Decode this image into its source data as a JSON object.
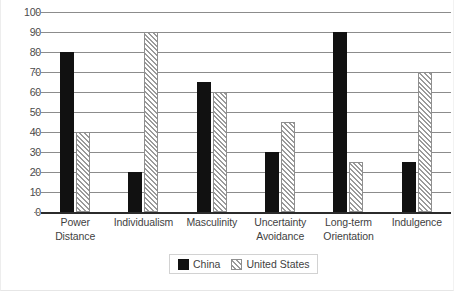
{
  "chart_data": {
    "type": "bar",
    "title": "",
    "xlabel": "",
    "ylabel": "",
    "ylim": [
      0,
      100
    ],
    "yticks": [
      0,
      10,
      20,
      30,
      40,
      50,
      60,
      70,
      80,
      90,
      100
    ],
    "ytick_labels": [
      "0",
      "10",
      "20",
      "30",
      "40",
      "50",
      "60",
      "70",
      "80",
      "90",
      "100"
    ],
    "grid": true,
    "legend_position": "bottom-center",
    "categories": [
      "Power Distance",
      "Individualism",
      "Masculinity",
      "Uncertainty Avoidance",
      "Long-term Orientation",
      "Indulgence"
    ],
    "category_lines": [
      [
        "Power",
        "Distance"
      ],
      [
        "Individualism"
      ],
      [
        "Masculinity"
      ],
      [
        "Uncertainty",
        "Avoidance"
      ],
      [
        "Long-term",
        "Orientation"
      ],
      [
        "Indulgence"
      ]
    ],
    "series": [
      {
        "name": "China",
        "values": [
          80,
          20,
          65,
          30,
          90,
          25
        ],
        "color": "#111111",
        "pattern": "solid"
      },
      {
        "name": "United States",
        "values": [
          40,
          90,
          60,
          45,
          25,
          70
        ],
        "color": "#c9c9c9",
        "pattern": "diagonal-hatch"
      }
    ]
  },
  "legend": {
    "entries": [
      {
        "label": "China",
        "swatch": "solid-black-swatch"
      },
      {
        "label": "United States",
        "swatch": "hatched-gray-swatch"
      }
    ]
  },
  "colors": {
    "background": "#ffffff",
    "gridline": "#8c8c8c",
    "axis": "#2b2b2b",
    "text": "#3f3f3f",
    "series_china": "#111111",
    "series_united_states": "#c9c9c9"
  }
}
